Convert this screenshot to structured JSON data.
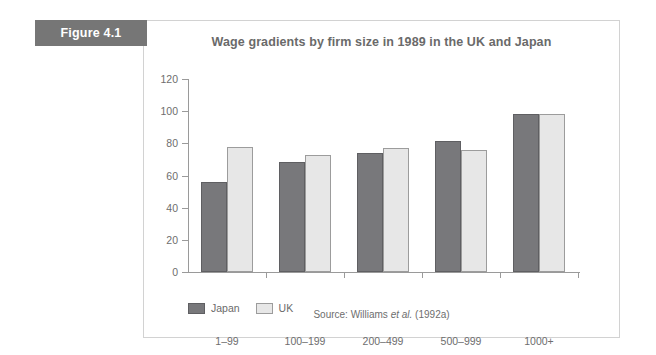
{
  "figure": {
    "label": "Figure 4.1"
  },
  "source": {
    "prefix": "Source: Williams ",
    "italic": "et al.",
    "suffix": " (1992a)"
  },
  "legend": {
    "items": [
      {
        "label": "Japan",
        "color": "#78787b"
      },
      {
        "label": "UK",
        "color": "#e7e7e7"
      }
    ]
  },
  "chart_data": {
    "type": "bar",
    "title": "Wage gradients by firm size in 1989 in the UK and Japan",
    "xlabel": "",
    "ylabel": "",
    "categories": [
      "1–99",
      "100–199",
      "200–499",
      "500–999",
      "1000+"
    ],
    "series": [
      {
        "name": "Japan",
        "color": "#78787b",
        "values": [
          56,
          68.5,
          74,
          81.5,
          98
        ]
      },
      {
        "name": "UK",
        "color": "#e7e7e7",
        "values": [
          78,
          72.5,
          77,
          76,
          98
        ]
      }
    ],
    "ylim": [
      0,
      120
    ],
    "yticks": [
      0,
      20,
      40,
      60,
      80,
      100,
      120
    ],
    "grid": false,
    "legend_position": "bottom-left"
  }
}
